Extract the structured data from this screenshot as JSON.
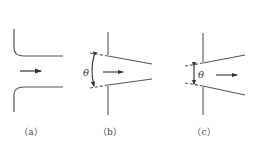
{
  "diagram": {
    "type": "nozzle-inlet-geometries",
    "panels": [
      {
        "id": "a",
        "label": "（a）",
        "description": "rounded inlet with flow arrow"
      },
      {
        "id": "b",
        "label": "（b）",
        "description": "converging conical inlet with angle",
        "angle_symbol": "θ"
      },
      {
        "id": "c",
        "label": "（c）",
        "description": "diverging conical inlet with angle",
        "angle_symbol": "θ"
      }
    ],
    "colors": {
      "line": "#555555",
      "background": "#ffffff"
    }
  }
}
